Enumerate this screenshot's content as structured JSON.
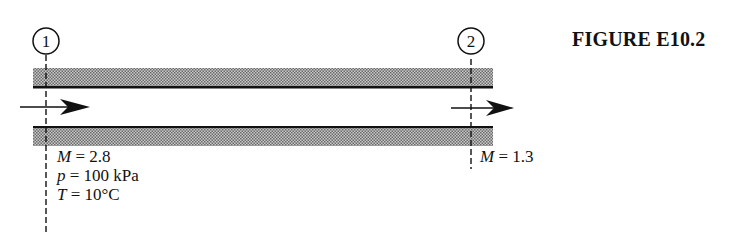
{
  "figure": {
    "title": "FIGURE E10.2",
    "colors": {
      "ink": "#111111",
      "wall_shading": "#9a9a9a",
      "background": "#ffffff"
    }
  },
  "stations": [
    {
      "id": "1",
      "label": "1",
      "conditions": [
        {
          "symbol": "M",
          "eq": " = ",
          "value": "2.8"
        },
        {
          "symbol": "p",
          "eq": " = ",
          "value": "100 kPa"
        },
        {
          "symbol": "T",
          "eq": " = ",
          "value": "10°C"
        }
      ]
    },
    {
      "id": "2",
      "label": "2",
      "conditions": [
        {
          "symbol": "M",
          "eq": " = ",
          "value": "1.3"
        }
      ]
    }
  ],
  "duct": {
    "flow_direction": "left-to-right",
    "walls": [
      "top-wall",
      "bottom-wall"
    ]
  }
}
